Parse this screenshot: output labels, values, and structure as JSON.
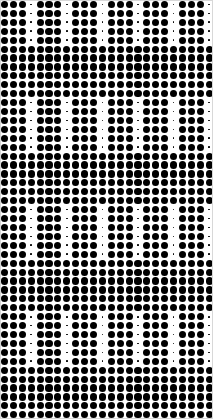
{
  "canvas": {
    "width": 213,
    "height": 419,
    "background_color": "#ffffff",
    "border_color": "#d8d8d8",
    "description": "Halftone dot grid pattern"
  },
  "pattern": {
    "name": "modulated-halftone-dot-grid",
    "dot_color": "#000000",
    "grid_pitch_x": 8.9,
    "grid_pitch_y": 8.92,
    "columns": 24,
    "rows": 47,
    "origin_x": 4.5,
    "origin_y": 4.5,
    "large_dot_diameter": 7.2,
    "small_dot_diameter": 1.7,
    "column_period": 4,
    "column_small_index": 3,
    "row_period": 12,
    "row_modulated_count": 6,
    "row_full_count": 6,
    "row_phase_offset": 1
  },
  "legend": {
    "large_dot_label": "large dot",
    "small_dot_label": "small dot",
    "pattern_label": "Halftone dot grid"
  }
}
